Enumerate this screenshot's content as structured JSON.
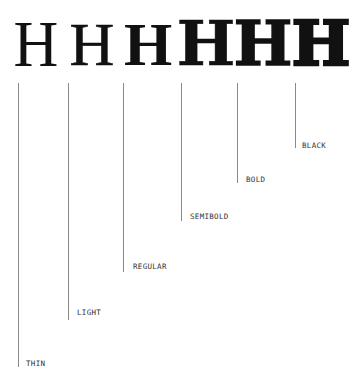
{
  "weights": [
    {
      "glyph": "H",
      "label": "THIN",
      "glyph_x": 36,
      "line_x": 18,
      "line_end_y": 367,
      "label_x": 26,
      "label_y": 359
    },
    {
      "glyph": "H",
      "label": "LIGHT",
      "glyph_x": 92,
      "line_x": 68,
      "line_end_y": 320,
      "label_x": 77,
      "label_y": 308
    },
    {
      "glyph": "H",
      "label": "REGULAR",
      "glyph_x": 148,
      "line_x": 123,
      "line_end_y": 272,
      "label_x": 133,
      "label_y": 262
    },
    {
      "glyph": "H",
      "label": "SEMIBOLD",
      "glyph_x": 206,
      "line_x": 181,
      "line_end_y": 221,
      "label_x": 190,
      "label_y": 212
    },
    {
      "glyph": "H",
      "label": "BOLD",
      "glyph_x": 263,
      "line_x": 237,
      "line_end_y": 183,
      "label_x": 246,
      "label_y": 175
    },
    {
      "glyph": "H",
      "label": "BLACK",
      "glyph_x": 321,
      "line_x": 295,
      "line_end_y": 148,
      "label_x": 302,
      "label_y": 141
    }
  ],
  "colors": {
    "glyph": "#111111",
    "leader_line": "#8a8a8a",
    "label": "#333333",
    "background": "#ffffff"
  }
}
